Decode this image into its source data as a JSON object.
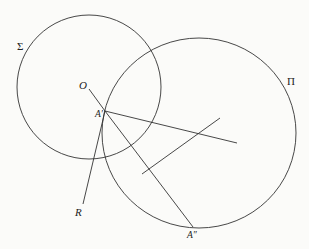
{
  "diagram": {
    "stroke_color": "#333333",
    "background": "#fbfbf9",
    "circles": [
      {
        "name": "Sigma",
        "label": "Σ",
        "cx": 89,
        "cy": 87,
        "r": 72
      },
      {
        "name": "Pi",
        "label": "Π",
        "cx": 199,
        "cy": 133,
        "rx": 97,
        "ry": 95
      }
    ],
    "points": [
      {
        "name": "O",
        "label": "O",
        "x": 89,
        "y": 89
      },
      {
        "name": "A-prime",
        "label": "A′",
        "x": 105,
        "y": 111
      },
      {
        "name": "R",
        "label": "R",
        "x": 83,
        "y": 204
      },
      {
        "name": "A-double-prime",
        "label": "A″",
        "x": 193,
        "y": 227
      }
    ],
    "segments": [
      {
        "name": "O-to-A-prime",
        "from": [
          89,
          89
        ],
        "to": [
          105,
          111
        ]
      },
      {
        "name": "A-prime-to-R",
        "from": [
          105,
          111
        ],
        "to": [
          83,
          204
        ]
      },
      {
        "name": "A-prime-to-A-double-prime",
        "from": [
          105,
          111
        ],
        "to": [
          193,
          227
        ]
      },
      {
        "name": "A-prime-ray-right",
        "from": [
          105,
          111
        ],
        "to": [
          237,
          143
        ]
      },
      {
        "name": "bisector-line",
        "from": [
          142,
          174
        ],
        "to": [
          220,
          118
        ]
      }
    ],
    "labels": {
      "sigma": "Σ",
      "pi": "Π",
      "o": "O",
      "a_prime": "A′",
      "r": "R",
      "a_double_prime": "A″"
    }
  }
}
